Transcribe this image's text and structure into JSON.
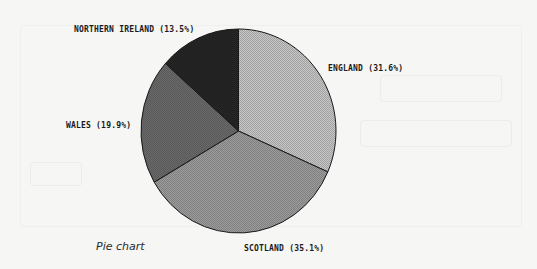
{
  "caption": "Pie chart",
  "labels": {
    "england": "ENGLAND (31.6%)",
    "scotland": "SCOTLAND (35.1%)",
    "wales": "WALES (19.9%)",
    "northern_ireland": "NORTHERN IRELAND (13.5%)"
  },
  "colors": {
    "england": "#c6c6c6",
    "scotland": "#9c9c9c",
    "wales": "#6b6b6b",
    "northern_ireland": "#262626",
    "outline": "#1a1a1a"
  },
  "chart_data": {
    "type": "pie",
    "title": "",
    "caption": "Pie chart",
    "categories": [
      "England",
      "Scotland",
      "Wales",
      "Northern Ireland"
    ],
    "values": [
      31.6,
      35.1,
      19.9,
      13.5
    ],
    "unit": "%",
    "start_angle": "12 o'clock",
    "direction": "clockwise",
    "legend": "none (direct labels)",
    "labels": [
      "ENGLAND (31.6%)",
      "SCOTLAND (35.1%)",
      "WALES (19.9%)",
      "NORTHERN IRELAND (13.5%)"
    ]
  }
}
